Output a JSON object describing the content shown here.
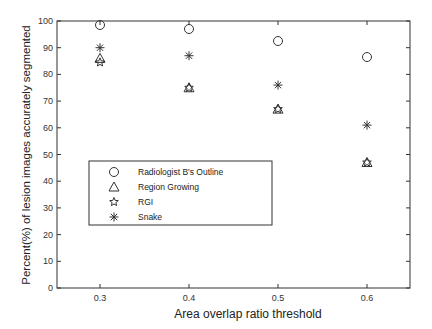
{
  "chart_data": {
    "type": "scatter",
    "title": "",
    "xlabel": "Area overlap ratio threshold",
    "ylabel": "Percent(%) of lesion images accurately segmented",
    "x": [
      0.3,
      0.4,
      0.5,
      0.6
    ],
    "xticks": [
      "0.3",
      "0.4",
      "0.5",
      "0.6"
    ],
    "xlim": [
      0.225,
      0.66
    ],
    "ylim": [
      0,
      100
    ],
    "yticks": [
      "0",
      "10",
      "20",
      "30",
      "40",
      "50",
      "60",
      "70",
      "80",
      "90",
      "100"
    ],
    "grid": false,
    "legend_position": "lower-left (inside)",
    "series": [
      {
        "name": "Radiologist B's Outline",
        "marker": "circle",
        "values": [
          98.5,
          97,
          92.5,
          86.5
        ]
      },
      {
        "name": "Region Growing",
        "marker": "triangle",
        "values": [
          86,
          75,
          67,
          47
        ]
      },
      {
        "name": "RGI",
        "marker": "star",
        "values": [
          84.5,
          75,
          67,
          47
        ]
      },
      {
        "name": "Snake",
        "marker": "asterisk",
        "values": [
          90,
          87,
          76,
          61
        ]
      }
    ]
  },
  "legend": {
    "items": [
      {
        "label": "Radiologist B's Outline",
        "symbol": "○"
      },
      {
        "label": "Region Growing",
        "symbol": "△"
      },
      {
        "label": "RGI",
        "symbol": "☆"
      },
      {
        "label": "Snake",
        "symbol": "✱"
      }
    ]
  },
  "colors": {
    "axis": "#333333",
    "marker": "#333333",
    "background": "#ffffff"
  }
}
